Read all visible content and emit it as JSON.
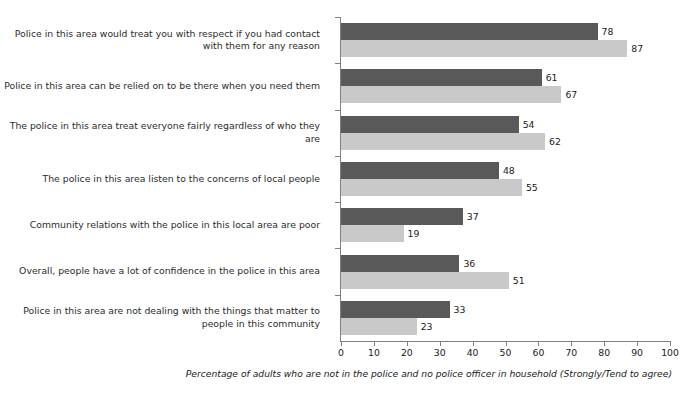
{
  "chart_data": {
    "type": "bar",
    "orientation": "horizontal",
    "title": "",
    "xlabel": "",
    "ylabel": "",
    "xlim": [
      0,
      100
    ],
    "xticks": [
      0,
      10,
      20,
      30,
      40,
      50,
      60,
      70,
      80,
      90,
      100
    ],
    "grid": false,
    "legend": "none",
    "footnote": "Percentage of adults who are not in the police and no police officer in household (Strongly/Tend to agree)",
    "categories": [
      "Police in this area would treat you with respect if you had contact with them for any reason",
      "Police in this area can be relied on to be there when you need them",
      "The police in this area treat everyone fairly regardless of who they are",
      "The police in this area listen to the concerns of local people",
      "Community relations with the police in this local area are poor",
      "Overall, people have a lot of confidence in the police in this area",
      "Police in this area are not dealing with the things that matter to people in this community"
    ],
    "series": [
      {
        "name": "series-1",
        "color": "#595959",
        "values": [
          78,
          61,
          54,
          48,
          37,
          36,
          33
        ]
      },
      {
        "name": "series-2",
        "color": "#c9c9c9",
        "values": [
          87,
          67,
          62,
          55,
          19,
          51,
          23
        ]
      }
    ]
  },
  "colors": {
    "background": "#ffffff",
    "axis": "#808080",
    "text": "#1a1a1a",
    "label_text": "#2b2b2b",
    "series_dark": "#595959",
    "series_light": "#c9c9c9"
  }
}
